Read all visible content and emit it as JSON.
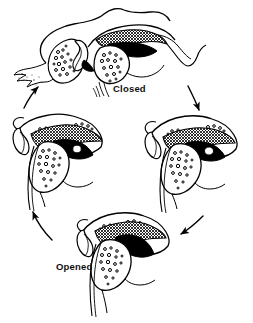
{
  "figure": {
    "type": "anatomical-line-drawing",
    "background_color": "#ffffff",
    "ink_color": "#000000",
    "width": 253,
    "height": 323,
    "cycle_direction": "clockwise"
  },
  "labels": {
    "closed": "Closed",
    "opened": "Opened"
  },
  "panels": [
    {
      "id": "closed",
      "position": "top",
      "label": "Closed",
      "description": "Condyle seated in glenoid fossa with disc interposed; articular eminence at right, stippled bone marrow texture"
    },
    {
      "id": "translating-forward",
      "position": "right",
      "label": "",
      "description": "Condyle translating forward down the articular eminence, disc hatched superiorly"
    },
    {
      "id": "opened",
      "position": "bottom",
      "label": "Opened",
      "description": "Condyle fully translated anteriorly beneath the articular eminence, maximum opening"
    },
    {
      "id": "translating-back",
      "position": "left",
      "label": "",
      "description": "Condyle translating back toward the fossa during closing"
    }
  ],
  "arrows": [
    {
      "id": "closed-to-right",
      "from": "closed",
      "to": "translating-forward",
      "direction": "down-right"
    },
    {
      "id": "right-to-opened",
      "from": "translating-forward",
      "to": "opened",
      "direction": "down-left"
    },
    {
      "id": "opened-to-left",
      "from": "opened",
      "to": "translating-back",
      "direction": "up-left"
    },
    {
      "id": "left-to-closed",
      "from": "translating-back",
      "to": "closed",
      "direction": "up-right"
    }
  ]
}
